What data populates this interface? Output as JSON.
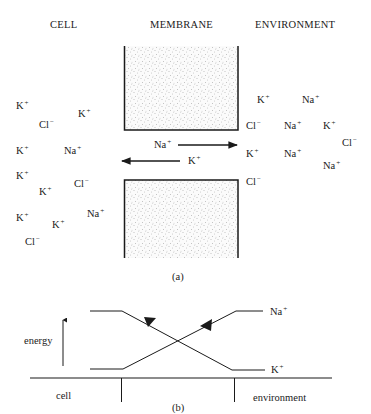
{
  "panel_a": {
    "headers": {
      "cell": "CELL",
      "membrane": "MEMBRANE",
      "environment": "ENVIRONMENT"
    },
    "cell_ions": [
      {
        "base": "K",
        "charge": "+",
        "x": 16,
        "y": 100
      },
      {
        "base": "K",
        "charge": "+",
        "x": 78,
        "y": 108
      },
      {
        "base": "Cl",
        "charge": "−",
        "x": 39,
        "y": 119
      },
      {
        "base": "K",
        "charge": "+",
        "x": 16,
        "y": 145
      },
      {
        "base": "Na",
        "charge": "+",
        "x": 64,
        "y": 145
      },
      {
        "base": "K",
        "charge": "+",
        "x": 16,
        "y": 170
      },
      {
        "base": "Cl",
        "charge": "−",
        "x": 74,
        "y": 178
      },
      {
        "base": "K",
        "charge": "+",
        "x": 39,
        "y": 186
      },
      {
        "base": "Na",
        "charge": "+",
        "x": 87,
        "y": 208
      },
      {
        "base": "K",
        "charge": "+",
        "x": 16,
        "y": 212
      },
      {
        "base": "K",
        "charge": "+",
        "x": 52,
        "y": 219
      },
      {
        "base": "Cl",
        "charge": "−",
        "x": 25,
        "y": 236
      }
    ],
    "environment_ions": [
      {
        "base": "K",
        "charge": "+",
        "x": 257,
        "y": 94
      },
      {
        "base": "Na",
        "charge": "+",
        "x": 302,
        "y": 94
      },
      {
        "base": "Cl",
        "charge": "−",
        "x": 246,
        "y": 120
      },
      {
        "base": "Na",
        "charge": "+",
        "x": 284,
        "y": 120
      },
      {
        "base": "K",
        "charge": "+",
        "x": 323,
        "y": 120
      },
      {
        "base": "Cl",
        "charge": "−",
        "x": 342,
        "y": 137
      },
      {
        "base": "K",
        "charge": "+",
        "x": 246,
        "y": 148
      },
      {
        "base": "Na",
        "charge": "+",
        "x": 284,
        "y": 148
      },
      {
        "base": "Na",
        "charge": "+",
        "x": 323,
        "y": 160
      },
      {
        "base": "Cl",
        "charge": "−",
        "x": 246,
        "y": 176
      }
    ],
    "channel_arrows": [
      {
        "ion": "Na",
        "charge": "+",
        "direction": "out",
        "label_x": 154,
        "label_y": 140
      },
      {
        "ion": "K",
        "charge": "+",
        "direction": "in",
        "label_x": 188,
        "label_y": 156
      }
    ],
    "caption": "(a)"
  },
  "panel_b": {
    "y_axis_label": "energy",
    "region_labels": {
      "left": "cell",
      "right": "environment"
    },
    "curve_labels": [
      {
        "base": "Na",
        "charge": "+"
      },
      {
        "base": "K",
        "charge": "+"
      }
    ],
    "caption": "(b)"
  }
}
